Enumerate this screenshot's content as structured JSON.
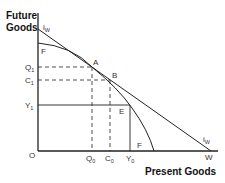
{
  "axes": {
    "y_title_line1": "Future",
    "y_title_line2": "Goods",
    "x_title": "Present Goods",
    "origin": "O"
  },
  "curves": {
    "world_interest_line": {
      "label": "i",
      "sub": "W"
    },
    "world_interest_line_end": {
      "label": "i",
      "sub": "W"
    },
    "ppf_top": "F",
    "ppf_bottom": "F"
  },
  "points": {
    "A": "A",
    "B": "B",
    "E": "E",
    "W": "W"
  },
  "y_ticks": [
    {
      "label": "Q",
      "sub": "1"
    },
    {
      "label": "C",
      "sub": "1"
    },
    {
      "label": "Y",
      "sub": "1"
    }
  ],
  "x_ticks": [
    {
      "label": "Q",
      "sub": "0"
    },
    {
      "label": "C",
      "sub": "0"
    },
    {
      "label": "Y",
      "sub": "0"
    }
  ],
  "colors": {
    "line": "#222222",
    "background": "#ffffff"
  }
}
